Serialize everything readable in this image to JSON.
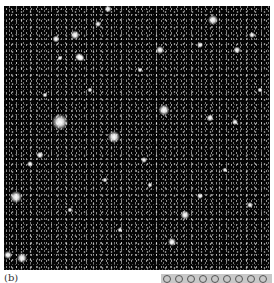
{
  "figure": {
    "panel_label": "(b)"
  },
  "colors": {
    "background": "#050505",
    "star": "#ffffff",
    "frame": "#ffffff"
  },
  "stars": [
    {
      "x": 60,
      "y": 122,
      "r": 16
    },
    {
      "x": 75,
      "y": 35,
      "r": 9
    },
    {
      "x": 79,
      "y": 57,
      "r": 8
    },
    {
      "x": 114,
      "y": 137,
      "r": 12
    },
    {
      "x": 81,
      "y": 58,
      "r": 7
    },
    {
      "x": 56,
      "y": 39,
      "r": 7
    },
    {
      "x": 164,
      "y": 110,
      "r": 11
    },
    {
      "x": 160,
      "y": 50,
      "r": 8
    },
    {
      "x": 213,
      "y": 20,
      "r": 10
    },
    {
      "x": 16,
      "y": 197,
      "r": 12
    },
    {
      "x": 22,
      "y": 258,
      "r": 10
    },
    {
      "x": 8,
      "y": 255,
      "r": 8
    },
    {
      "x": 185,
      "y": 215,
      "r": 9
    },
    {
      "x": 172,
      "y": 242,
      "r": 8
    },
    {
      "x": 237,
      "y": 50,
      "r": 7
    },
    {
      "x": 252,
      "y": 35,
      "r": 6
    },
    {
      "x": 108,
      "y": 9,
      "r": 7
    },
    {
      "x": 98,
      "y": 24,
      "r": 6
    },
    {
      "x": 200,
      "y": 45,
      "r": 6
    },
    {
      "x": 210,
      "y": 118,
      "r": 7
    },
    {
      "x": 235,
      "y": 122,
      "r": 6
    },
    {
      "x": 40,
      "y": 155,
      "r": 7
    },
    {
      "x": 30,
      "y": 164,
      "r": 6
    },
    {
      "x": 200,
      "y": 196,
      "r": 6
    },
    {
      "x": 60,
      "y": 58,
      "r": 5
    },
    {
      "x": 90,
      "y": 90,
      "r": 5
    },
    {
      "x": 144,
      "y": 160,
      "r": 6
    },
    {
      "x": 250,
      "y": 205,
      "r": 6
    },
    {
      "x": 120,
      "y": 230,
      "r": 5
    },
    {
      "x": 70,
      "y": 210,
      "r": 5
    },
    {
      "x": 150,
      "y": 185,
      "r": 5
    },
    {
      "x": 225,
      "y": 170,
      "r": 5
    },
    {
      "x": 140,
      "y": 70,
      "r": 5
    },
    {
      "x": 45,
      "y": 95,
      "r": 5
    },
    {
      "x": 105,
      "y": 180,
      "r": 5
    },
    {
      "x": 260,
      "y": 90,
      "r": 5
    }
  ],
  "legend_strip": {
    "items": [
      "o",
      "o",
      "o",
      "o",
      "o",
      "o",
      "o",
      "o",
      "o",
      "o",
      "o",
      "o"
    ]
  }
}
